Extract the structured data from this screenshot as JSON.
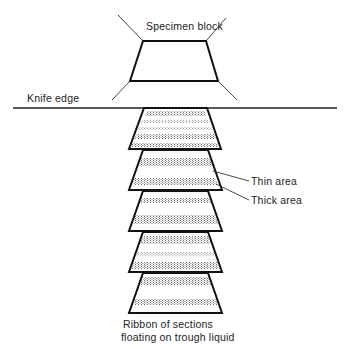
{
  "labels": {
    "specimen_block": "Specimen block",
    "knife_edge": "Knife edge",
    "thin_area": "Thin area",
    "thick_area": "Thick area",
    "caption_line1": "Ribbon of sections",
    "caption_line2": "floating on trough liquid"
  },
  "colors": {
    "ink": "#111111",
    "stipple": "#6a6a6a",
    "background": "#ffffff"
  },
  "specimen_block": {
    "top_left": [
      143,
      41
    ],
    "top_right": [
      206,
      41
    ],
    "bottom_right": [
      218,
      81
    ],
    "bottom_left": [
      130,
      81
    ]
  },
  "knife_edge_line": {
    "x1": 13,
    "x2": 337,
    "y": 108
  },
  "sections": [
    {
      "index": 1,
      "top": 108,
      "bottom": 149
    },
    {
      "index": 2,
      "top": 150,
      "bottom": 190
    },
    {
      "index": 3,
      "top": 191,
      "bottom": 231
    },
    {
      "index": 4,
      "top": 232,
      "bottom": 272
    },
    {
      "index": 5,
      "top": 273,
      "bottom": 313
    }
  ]
}
